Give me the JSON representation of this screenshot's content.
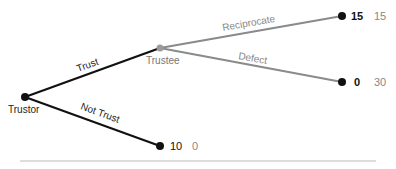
{
  "diagram": {
    "type": "game-tree",
    "colors": {
      "player1_branch": "#111111",
      "player2_branch": "#8a8a8a",
      "player2_node": "#9a9a9a",
      "terminal_node": "#111111",
      "player1_payoff": "#111111",
      "player2_payoff": "#888888",
      "divider": "#bbbbbb"
    },
    "nodes": {
      "trustor": {
        "label": "Trustor"
      },
      "trustee": {
        "label": "Trustee"
      }
    },
    "branches": {
      "trust": {
        "label": "Trust"
      },
      "not_trust": {
        "label": "Not Trust"
      },
      "reciprocate": {
        "label": "Reciprocate"
      },
      "defect": {
        "label": "Defect"
      }
    },
    "outcomes": {
      "reciprocate": {
        "trustor_payoff": "15",
        "trustee_payoff": "15"
      },
      "defect": {
        "trustor_payoff": "0",
        "trustee_payoff": "30"
      },
      "not_trust": {
        "trustor_payoff": "10",
        "trustee_payoff": "0"
      }
    }
  }
}
